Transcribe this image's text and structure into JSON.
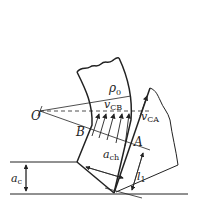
{
  "diagram": {
    "title": "",
    "colors": {
      "line": "#222222",
      "background": "#ffffff"
    },
    "labels": {
      "rho": {
        "symbol": "ρ",
        "sub": "0"
      },
      "v_cb": {
        "symbol": "v",
        "sub": "CB"
      },
      "v_ca": {
        "symbol": "v",
        "sub": "CA"
      },
      "point_o": "O",
      "point_b": "B",
      "point_a": "A",
      "a_ch": {
        "symbol": "a",
        "sub": "ch"
      },
      "a_c": {
        "symbol": "a",
        "sub": "c"
      },
      "l1": {
        "symbol": "l",
        "sub": "1"
      }
    }
  }
}
